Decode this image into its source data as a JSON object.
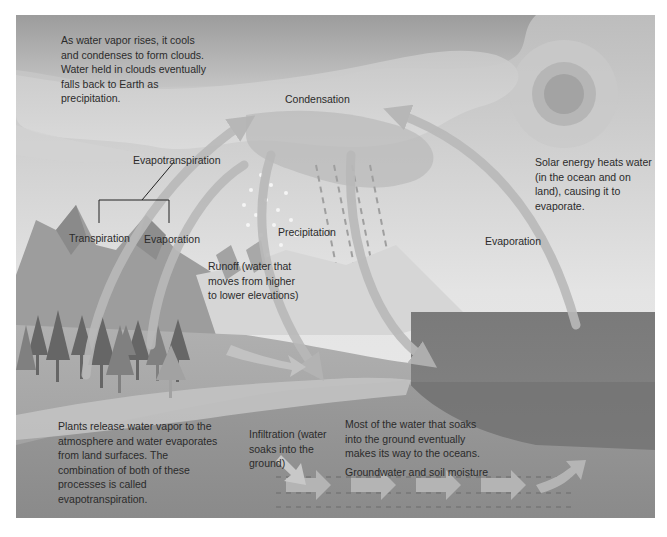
{
  "diagram": {
    "colors": {
      "sky_top": "#b8b8b8",
      "sky_bottom": "#e6e6e6",
      "cloud_dark": "#a9a9a9",
      "cloud_light": "#cfcfcf",
      "sun_outer": "#c7c7c7",
      "sun_middle": "#b3b3b3",
      "sun_core": "#9e9e9e",
      "land": "#a6a6a6",
      "ground_dark": "#8f8f8f",
      "ocean_surface": "#7d7d7d",
      "ocean_deep": "#6f6f6f",
      "arrow": "#bdbdbd",
      "text": "#2b2b2b"
    },
    "annotations": {
      "clouds_note": "As water vapor rises, it cools and condenses to form clouds. Water held in clouds eventually falls back to Earth as precipitation.",
      "solar_note": "Solar energy heats water (in the ocean and on land), causing it to evaporate.",
      "plants_note": "Plants release water vapor to the atmosphere and water evaporates from land surfaces. The combination of both of these processes is called evapotranspiration.",
      "oceans_note": "Most of the water that soaks into the ground eventually makes its way to the oceans.",
      "runoff_note": "Runoff (water that moves from higher to lower elevations)",
      "infiltration_note": "Infiltration (water soaks into the ground)"
    },
    "labels": {
      "condensation": "Condensation",
      "evapotranspiration": "Evapotranspiration",
      "transpiration": "Transpiration",
      "evaporation_land": "Evaporation",
      "precipitation": "Precipitation",
      "evaporation_ocean": "Evaporation",
      "groundwater": "Groundwater and soil moisture"
    }
  }
}
